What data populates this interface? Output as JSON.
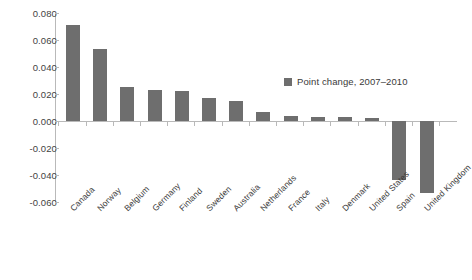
{
  "chart_data": {
    "type": "bar",
    "title": "",
    "xlabel": "",
    "ylabel": "",
    "ylim": [
      -0.06,
      0.08
    ],
    "ytick_labels": [
      "0.080",
      "0.060",
      "0.040",
      "0.020",
      "0.000",
      "-0.020",
      "-0.040",
      "-0.060"
    ],
    "ytick_values": [
      0.08,
      0.06,
      0.04,
      0.02,
      0.0,
      -0.02,
      -0.04,
      -0.06
    ],
    "grid": false,
    "legend_position": "inside-upper-right",
    "legend": [
      "Point change, 2007–2010"
    ],
    "series_color": "#6e6e6e",
    "categories": [
      "Canada",
      "Norway",
      "Belgium",
      "Germany",
      "Finland",
      "Sweden",
      "Australia",
      "Netherlands",
      "France",
      "Italy",
      "Denmark",
      "United States",
      "Spain",
      "United Kingdom"
    ],
    "series": [
      {
        "name": "Point change, 2007–2010",
        "values": [
          0.071,
          0.053,
          0.025,
          0.023,
          0.022,
          0.017,
          0.015,
          0.007,
          0.004,
          0.003,
          0.003,
          0.002,
          -0.044,
          -0.053
        ]
      }
    ]
  },
  "legend": {
    "label": "Point change, 2007–2010",
    "swatch_color": "#6e6e6e"
  }
}
